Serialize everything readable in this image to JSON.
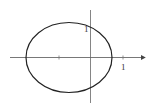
{
  "diagram": {
    "type": "ellipse-on-axes",
    "labels": {
      "y_axis_tick": "1",
      "x_axis_tick": "1"
    },
    "colors": {
      "stroke": "#222222",
      "axis": "#555555",
      "background": "#ffffff"
    }
  }
}
